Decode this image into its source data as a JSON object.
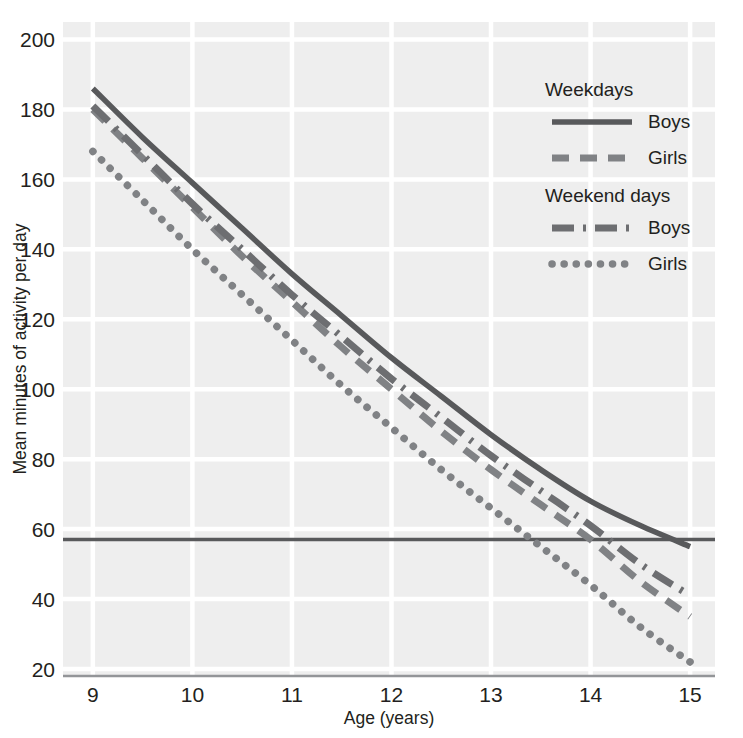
{
  "chart_data": {
    "type": "line",
    "title": "",
    "xlabel": "Age (years)",
    "ylabel": "Mean minutes of activity per day",
    "xlim": [
      8.7,
      15.25
    ],
    "ylim": [
      18,
      205
    ],
    "xticks": [
      "9",
      "10",
      "11",
      "12",
      "13",
      "14",
      "15"
    ],
    "xtick_values": [
      9,
      10,
      11,
      12,
      13,
      14,
      15
    ],
    "yticks": [
      "20",
      "40",
      "60",
      "80",
      "100",
      "120",
      "140",
      "160",
      "180",
      "200"
    ],
    "ytick_values": [
      20,
      40,
      60,
      80,
      100,
      120,
      140,
      160,
      180,
      200
    ],
    "grid": true,
    "grid_color": "#ffffff",
    "plot_background": "#eeeeee",
    "legend_position": "top-right",
    "x": [
      9,
      9.5,
      10,
      10.5,
      11,
      11.5,
      12,
      12.5,
      13,
      13.5,
      14,
      14.5,
      15
    ],
    "series": [
      {
        "name": "Weekdays Boys",
        "group": "Weekdays",
        "label": "Boys",
        "style": "solid",
        "color": "#58595b",
        "values": [
          186,
          172,
          159,
          146,
          133,
          121,
          109,
          98,
          87,
          77,
          68,
          61,
          55
        ]
      },
      {
        "name": "Weekdays Girls",
        "group": "Weekdays",
        "label": "Girls",
        "style": "dashed",
        "color": "#808285",
        "values": [
          180,
          166,
          152,
          138,
          125,
          112,
          100,
          88,
          77,
          67,
          57,
          45,
          35
        ]
      },
      {
        "name": "Weekend days Boys",
        "group": "Weekend days",
        "label": "Boys",
        "style": "dash-dot",
        "color": "#6d6e71",
        "values": [
          181,
          167,
          153,
          140,
          127,
          115,
          103,
          92,
          81,
          71,
          61,
          50,
          41
        ]
      },
      {
        "name": "Weekend days Girls",
        "group": "Weekend days",
        "label": "Girls",
        "style": "dotted",
        "color": "#808285",
        "values": [
          168,
          154,
          140,
          127,
          114,
          101,
          89,
          77,
          66,
          55,
          44,
          32,
          22
        ]
      }
    ],
    "reference_line": {
      "value": 57,
      "orientation": "horizontal",
      "color": "#58595b"
    },
    "annotations": []
  },
  "legend": {
    "groups": [
      {
        "heading": "Weekdays",
        "items": [
          {
            "label": "Boys",
            "style": "solid"
          },
          {
            "label": "Girls",
            "style": "dashed"
          }
        ]
      },
      {
        "heading": "Weekend days",
        "items": [
          {
            "label": "Boys",
            "style": "dash-dot"
          },
          {
            "label": "Girls",
            "style": "dotted"
          }
        ]
      }
    ]
  }
}
